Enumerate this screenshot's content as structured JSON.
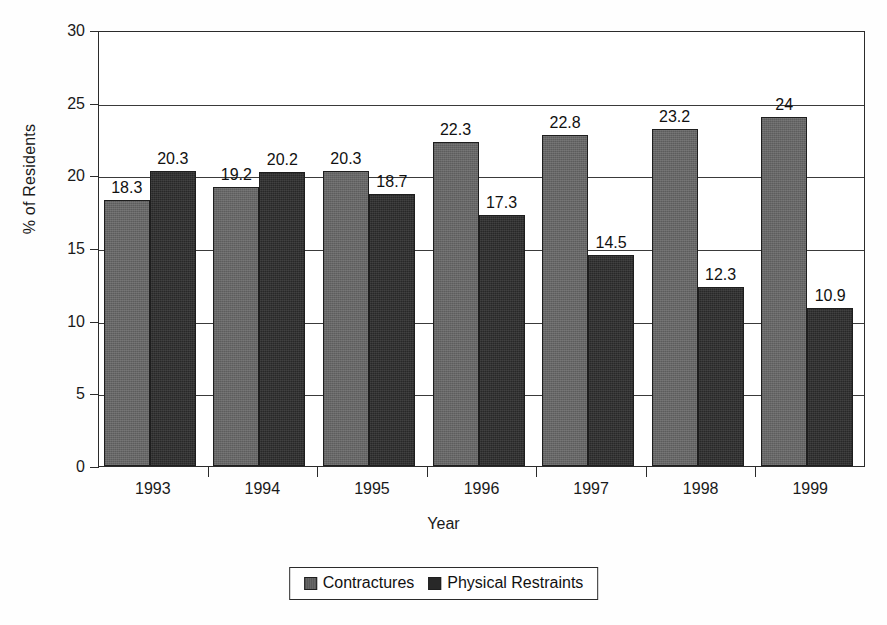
{
  "chart_data": {
    "type": "bar",
    "title": "",
    "subtitle": "",
    "xlabel": "Year",
    "ylabel": "% of Residents",
    "categories": [
      "1993",
      "1994",
      "1995",
      "1996",
      "1997",
      "1998",
      "1999"
    ],
    "series": [
      {
        "name": "Contractures",
        "color": "#676767",
        "values": [
          18.3,
          19.2,
          20.3,
          22.3,
          22.8,
          23.2,
          24
        ],
        "labels": [
          "18.3",
          "19.2",
          "20.3",
          "22.3",
          "22.8",
          "23.2",
          "24"
        ]
      },
      {
        "name": "Physical Restraints",
        "color": "#282828",
        "values": [
          20.3,
          20.2,
          18.7,
          17.3,
          14.5,
          12.3,
          10.9
        ],
        "labels": [
          "20.3",
          "20.2",
          "18.7",
          "17.3",
          "14.5",
          "12.3",
          "10.9"
        ]
      }
    ],
    "ylim": [
      0,
      30
    ],
    "ytick_values": [
      0,
      5,
      10,
      15,
      20,
      25,
      30
    ],
    "ytick_labels": [
      "0",
      "5",
      "10",
      "15",
      "20",
      "25",
      "30"
    ],
    "grid": "horizontal",
    "legend_position": "bottom-center",
    "data_labels": true
  },
  "legend": {
    "entries": [
      {
        "label": "Contractures",
        "swatch": "gray-swatch"
      },
      {
        "label": "Physical Restraints",
        "swatch": "black-swatch"
      }
    ]
  },
  "axes": {
    "x_title": "Year",
    "y_title": "% of Residents"
  }
}
